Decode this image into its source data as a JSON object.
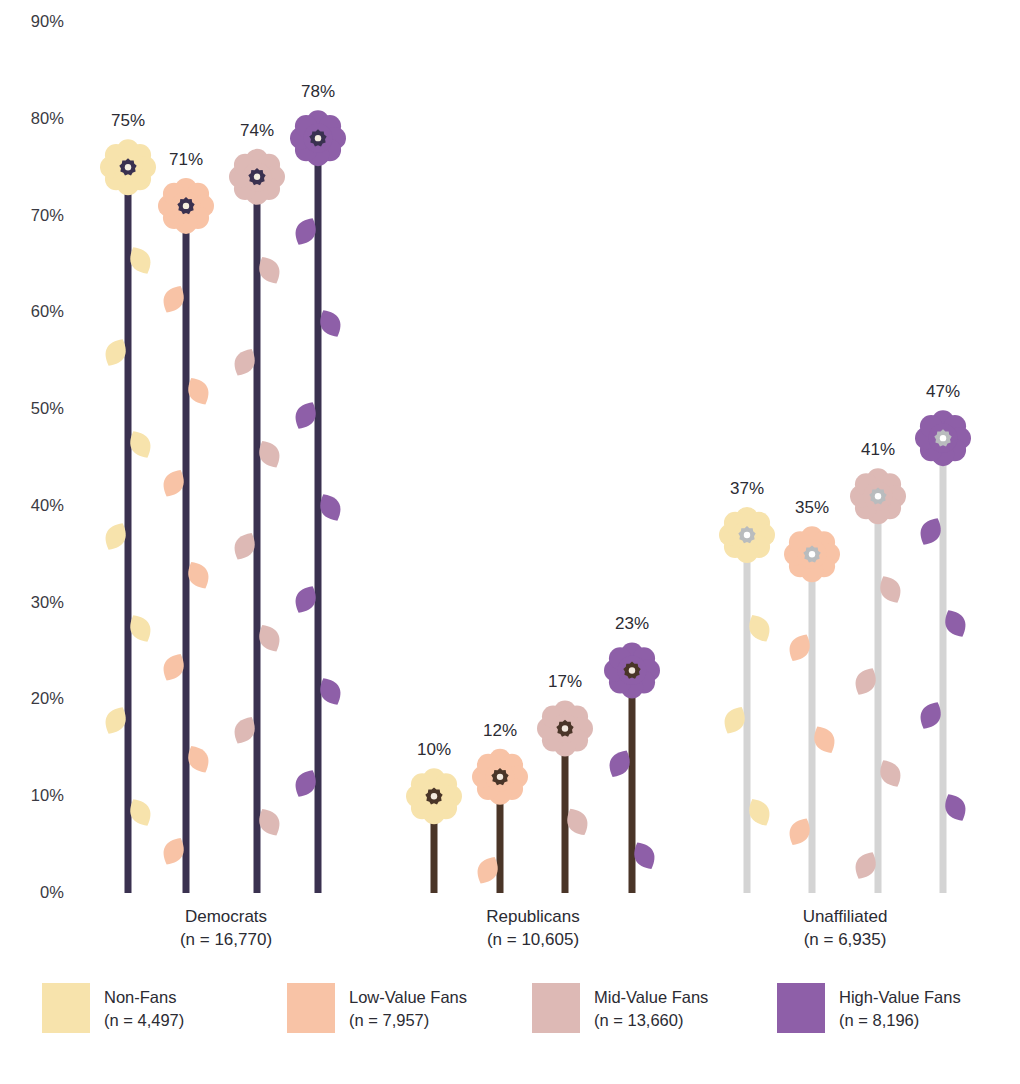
{
  "chart_data": {
    "type": "bar",
    "title": "",
    "subtitle": "",
    "xlabel": "",
    "ylabel": "",
    "ylim": [
      0,
      90
    ],
    "grid": false,
    "legend_position": "bottom",
    "ytick_labels": [
      "90%",
      "80%",
      "70%",
      "60%",
      "50%",
      "40%",
      "30%",
      "20%",
      "10%",
      "0%"
    ],
    "ytick_values": [
      90,
      80,
      70,
      60,
      50,
      40,
      30,
      20,
      10,
      0
    ],
    "categories": [
      "Democrats",
      "Republicans",
      "Unaffiliated"
    ],
    "category_notes": [
      "(n = 16,770)",
      "(n = 10,605)",
      "(n = 6,935)"
    ],
    "series": [
      {
        "name": "Non-Fans",
        "note": "(n = 4,497)",
        "color": "#f7e3ac",
        "values": [
          75,
          10,
          37
        ],
        "labels": [
          "75%",
          "10%",
          "37%"
        ]
      },
      {
        "name": "Low-Value Fans",
        "note": "(n = 7,957)",
        "color": "#f8c3a6",
        "values": [
          71,
          12,
          35
        ],
        "labels": [
          "71%",
          "12%",
          "35%"
        ]
      },
      {
        "name": "Mid-Value Fans",
        "note": "(n = 13,660)",
        "color": "#ddb9b5",
        "values": [
          74,
          17,
          41
        ],
        "labels": [
          "74%",
          "17%",
          "41%"
        ]
      },
      {
        "name": "High-Value Fans",
        "note": "(n = 8,196)",
        "color": "#8e5fa8",
        "values": [
          78,
          23,
          47
        ],
        "labels": [
          "78%",
          "23%",
          "47%"
        ]
      }
    ],
    "stem_colors": [
      "#3a3150",
      "#4a3528",
      "#d4d4d4"
    ],
    "center_colors": [
      "#3a3150",
      "#4a3528",
      "#b9bcbe"
    ],
    "center_hole_colors": [
      "#f5efe0",
      "#f3e9df",
      "#ffffff"
    ]
  },
  "axis": {
    "ticks": [
      {
        "label": "90%",
        "value": 90
      },
      {
        "label": "80%",
        "value": 80
      },
      {
        "label": "70%",
        "value": 70
      },
      {
        "label": "60%",
        "value": 60
      },
      {
        "label": "50%",
        "value": 50
      },
      {
        "label": "40%",
        "value": 40
      },
      {
        "label": "30%",
        "value": 30
      },
      {
        "label": "20%",
        "value": 20
      },
      {
        "label": "10%",
        "value": 10
      },
      {
        "label": "0%",
        "value": 0
      }
    ]
  },
  "groups": [
    {
      "name": "Democrats",
      "note": "(n = 16,770)",
      "stem_color": "#3a3150",
      "center_color": "#3a3150",
      "hole_color": "#f5efe0",
      "bars": [
        {
          "series": "Non-Fans",
          "value": 75,
          "label": "75%",
          "color": "#f7e3ac"
        },
        {
          "series": "Low-Value Fans",
          "value": 71,
          "label": "71%",
          "color": "#f8c3a6"
        },
        {
          "series": "Mid-Value Fans",
          "value": 74,
          "label": "74%",
          "color": "#ddb9b5"
        },
        {
          "series": "High-Value Fans",
          "value": 78,
          "label": "78%",
          "color": "#8e5fa8"
        }
      ]
    },
    {
      "name": "Republicans",
      "note": "(n = 10,605)",
      "stem_color": "#4a3528",
      "center_color": "#4a3528",
      "hole_color": "#f3e9df",
      "bars": [
        {
          "series": "Non-Fans",
          "value": 10,
          "label": "10%",
          "color": "#f7e3ac"
        },
        {
          "series": "Low-Value Fans",
          "value": 12,
          "label": "12%",
          "color": "#f8c3a6"
        },
        {
          "series": "Mid-Value Fans",
          "value": 17,
          "label": "17%",
          "color": "#ddb9b5"
        },
        {
          "series": "High-Value Fans",
          "value": 23,
          "label": "23%",
          "color": "#8e5fa8"
        }
      ]
    },
    {
      "name": "Unaffiliated",
      "note": "(n = 6,935)",
      "stem_color": "#d4d4d4",
      "center_color": "#b9bcbe",
      "hole_color": "#ffffff",
      "bars": [
        {
          "series": "Non-Fans",
          "value": 37,
          "label": "37%",
          "color": "#f7e3ac"
        },
        {
          "series": "Low-Value Fans",
          "value": 35,
          "label": "35%",
          "color": "#f8c3a6"
        },
        {
          "series": "Mid-Value Fans",
          "value": 41,
          "label": "41%",
          "color": "#ddb9b5"
        },
        {
          "series": "High-Value Fans",
          "value": 47,
          "label": "47%",
          "color": "#8e5fa8"
        }
      ]
    }
  ],
  "legend": {
    "items": [
      {
        "label": "Non-Fans",
        "note": "(n = 4,497)",
        "color": "#f7e3ac"
      },
      {
        "label": "Low-Value Fans",
        "note": "(n = 7,957)",
        "color": "#f8c3a6"
      },
      {
        "label": "Mid-Value Fans",
        "note": "(n = 13,660)",
        "color": "#ddb9b5"
      },
      {
        "label": "High-Value Fans",
        "note": "(n = 8,196)",
        "color": "#8e5fa8"
      }
    ]
  }
}
